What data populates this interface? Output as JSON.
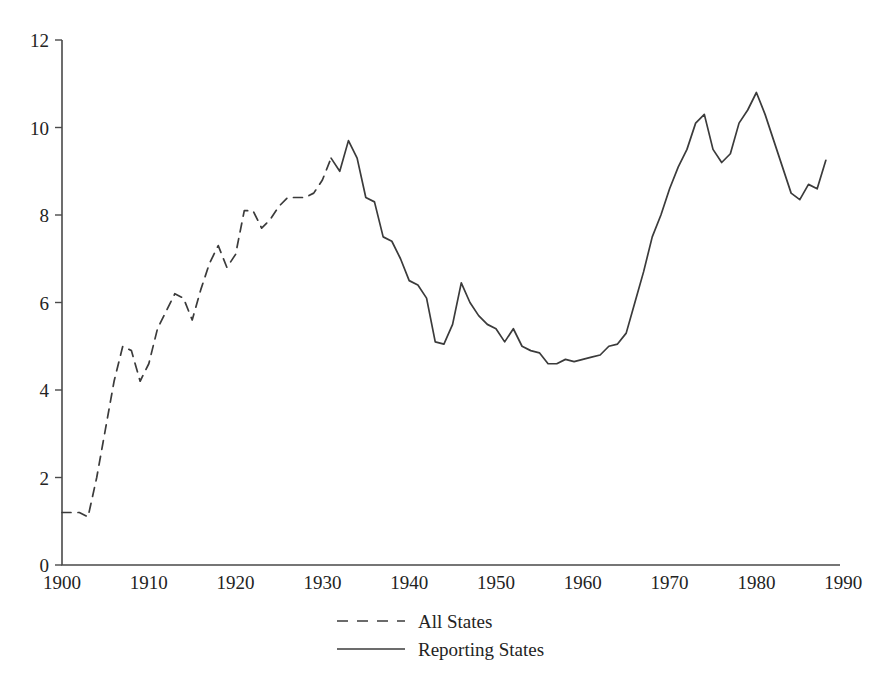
{
  "chart_data": {
    "type": "line",
    "title": "",
    "subtitle": "",
    "xlabel": "",
    "ylabel": "",
    "xlim": [
      1900,
      1990
    ],
    "ylim": [
      0,
      12
    ],
    "grid": false,
    "legend_position": "bottom-center",
    "x_ticks": [
      "1900",
      "1910",
      "1920",
      "1930",
      "1940",
      "1950",
      "1960",
      "1970",
      "1980",
      "1990"
    ],
    "x_tick_values": [
      1900,
      1910,
      1920,
      1930,
      1940,
      1950,
      1960,
      1970,
      1980,
      1990
    ],
    "y_ticks": [
      "0",
      "2",
      "4",
      "6",
      "8",
      "10",
      "12"
    ],
    "y_tick_values": [
      0,
      2,
      4,
      6,
      8,
      10,
      12
    ],
    "series": [
      {
        "name": "All States",
        "style": "dashed",
        "color": "#3b3b3b",
        "x": [
          1900,
          1901,
          1902,
          1903,
          1904,
          1905,
          1906,
          1907,
          1908,
          1909,
          1910,
          1911,
          1912,
          1913,
          1914,
          1915,
          1916,
          1917,
          1918,
          1919,
          1920,
          1921,
          1922,
          1923,
          1924,
          1925,
          1926,
          1927,
          1928,
          1929,
          1930,
          1931
        ],
        "values": [
          1.2,
          1.2,
          1.2,
          1.1,
          2.0,
          3.1,
          4.2,
          5.0,
          4.9,
          4.2,
          4.6,
          5.4,
          5.8,
          6.2,
          6.1,
          5.6,
          6.3,
          6.9,
          7.3,
          6.8,
          7.1,
          8.1,
          8.1,
          7.7,
          7.9,
          8.2,
          8.4,
          8.4,
          8.4,
          8.5,
          8.8,
          9.3
        ]
      },
      {
        "name": "Reporting States",
        "style": "solid",
        "color": "#3b3b3b",
        "x": [
          1931,
          1932,
          1933,
          1934,
          1935,
          1936,
          1937,
          1938,
          1939,
          1940,
          1941,
          1942,
          1943,
          1944,
          1945,
          1946,
          1947,
          1948,
          1949,
          1950,
          1951,
          1952,
          1953,
          1954,
          1955,
          1956,
          1957,
          1958,
          1959,
          1960,
          1961,
          1962,
          1963,
          1964,
          1965,
          1966,
          1967,
          1968,
          1969,
          1970,
          1971,
          1972,
          1973,
          1974,
          1975,
          1976,
          1977,
          1978,
          1979,
          1980,
          1981,
          1982,
          1983,
          1984,
          1985,
          1986,
          1987,
          1988
        ],
        "values": [
          9.3,
          9.0,
          9.7,
          9.3,
          8.4,
          8.3,
          7.5,
          7.4,
          7.0,
          6.5,
          6.4,
          6.1,
          5.1,
          5.05,
          5.5,
          6.45,
          6.0,
          5.7,
          5.5,
          5.4,
          5.1,
          5.4,
          5.0,
          4.9,
          4.85,
          4.6,
          4.6,
          4.7,
          4.65,
          4.7,
          4.75,
          4.8,
          5.0,
          5.05,
          5.3,
          6.0,
          6.7,
          7.5,
          8.0,
          8.6,
          9.1,
          9.5,
          10.1,
          10.3,
          9.5,
          9.2,
          9.4,
          10.1,
          10.4,
          10.8,
          10.3,
          9.7,
          9.1,
          8.5,
          8.35,
          8.7,
          8.6,
          9.25
        ]
      }
    ],
    "legend": [
      {
        "label": "All States",
        "style": "dashed"
      },
      {
        "label": "Reporting States",
        "style": "solid"
      }
    ]
  },
  "axis": {
    "axis_color": "#4a4a4a"
  }
}
